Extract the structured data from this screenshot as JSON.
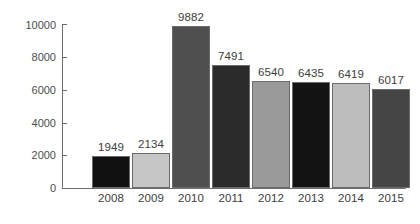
{
  "chart_data": {
    "type": "bar",
    "title": "",
    "subtitle": "",
    "xlabel": "",
    "ylabel": "",
    "categories": [
      "2008",
      "2009",
      "2010",
      "2011",
      "2012",
      "2013",
      "2014",
      "2015"
    ],
    "values": [
      1949,
      2134,
      9882,
      7491,
      6540,
      6435,
      6419,
      6017
    ],
    "value_labels": [
      "1949",
      "2134",
      "9882",
      "7491",
      "6540",
      "6435",
      "6419",
      "6017"
    ],
    "bar_colors": [
      "#111111",
      "#c6c6c6",
      "#4f4f4f",
      "#2b2b2b",
      "#9a9a9a",
      "#131313",
      "#bdbdbd",
      "#454545"
    ],
    "bar_border_color": "#6b6b6b",
    "ylim": [
      0,
      10000
    ],
    "y_ticks": [
      0,
      2000,
      4000,
      6000,
      8000,
      10000
    ],
    "y_tick_labels": [
      "0",
      "2000",
      "4000",
      "6000",
      "8000",
      "10000"
    ],
    "grid": false,
    "legend": null,
    "legend_position": "none",
    "axis_color": "#6e6e6e",
    "text_color": "#3d3d3d",
    "background_color": "#ffffff"
  }
}
